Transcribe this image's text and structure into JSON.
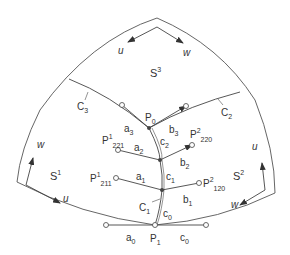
{
  "figure": {
    "patches": {
      "s3": {
        "base": "S",
        "sup": "3"
      },
      "s1": {
        "base": "S",
        "sup": "1"
      },
      "s2": {
        "base": "S",
        "sup": "2"
      }
    },
    "axes": {
      "top_u": "u",
      "top_w": "w",
      "left_w": "w",
      "left_u": "u",
      "right_u": "u",
      "right_w": "w"
    },
    "curves": {
      "c1": {
        "base": "C",
        "sub": "1"
      },
      "c2": {
        "base": "C",
        "sub": "2"
      },
      "c3": {
        "base": "C",
        "sub": "3"
      }
    },
    "points": {
      "p0": {
        "base": "P",
        "sub": "0"
      },
      "p1": {
        "base": "P",
        "sub": "1"
      },
      "p221": {
        "base": "P",
        "sup": "1",
        "sub": "221"
      },
      "p211": {
        "base": "P",
        "sup": "1",
        "sub": "211"
      },
      "p220": {
        "base": "P",
        "sup": "2",
        "sub": "220"
      },
      "p120": {
        "base": "P",
        "sup": "2",
        "sub": "120"
      }
    },
    "vectors": {
      "a3": {
        "base": "a",
        "sub": "3"
      },
      "b3": {
        "base": "b",
        "sub": "3"
      },
      "a2": {
        "base": "a",
        "sub": "2"
      },
      "b2": {
        "base": "b",
        "sub": "2"
      },
      "c2": {
        "base": "c",
        "sub": "2"
      },
      "a1": {
        "base": "a",
        "sub": "1"
      },
      "b1": {
        "base": "b",
        "sub": "1"
      },
      "c1": {
        "base": "c",
        "sub": "1"
      },
      "c0_upper": {
        "base": "c",
        "sub": "0"
      },
      "a0": {
        "base": "a",
        "sub": "0"
      },
      "c0_lower": {
        "base": "c",
        "sub": "0"
      }
    }
  }
}
